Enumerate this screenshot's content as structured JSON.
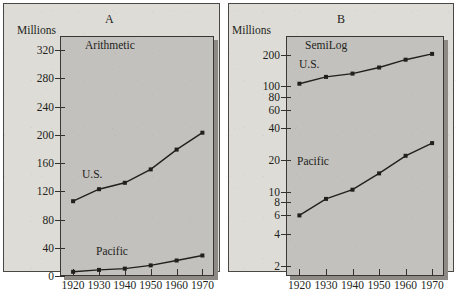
{
  "figure": {
    "axis_caption": "Millions",
    "panel_a_letter": "A",
    "panel_b_letter": "B",
    "panel_a_title": "Arithmetic",
    "panel_b_title": "SemiLog",
    "series_label_us": "U.S.",
    "series_label_pacific": "Pacific",
    "colors": {
      "page_background": "#ffffff",
      "panel_background": "#dedcd6",
      "plot_background": "#c2c1bd",
      "plot_shadow": "#8d8a86",
      "ink": "#231f1c",
      "axis": "#34312e"
    }
  },
  "chart_data": [
    {
      "type": "line",
      "title": "Arithmetic",
      "panel": "A",
      "xlabel": "",
      "ylabel": "Millions",
      "yscale": "linear",
      "ylim": [
        0,
        340
      ],
      "yticks": [
        0,
        40,
        80,
        120,
        160,
        200,
        240,
        280,
        320
      ],
      "ytick_labels": [
        "0",
        "40",
        "80",
        "120",
        "160",
        "200",
        "240",
        "280",
        "320"
      ],
      "x": [
        1920,
        1930,
        1940,
        1950,
        1960,
        1970
      ],
      "xtick_labels": [
        "1920",
        "1930",
        "1940",
        "1950",
        "1960",
        "1970"
      ],
      "grid": false,
      "legend": "inline annotations",
      "series": [
        {
          "name": "U.S.",
          "values": [
            106,
            123,
            132,
            151,
            179,
            203
          ]
        },
        {
          "name": "Pacific",
          "values": [
            6,
            8.6,
            10.5,
            15,
            22,
            29
          ]
        }
      ]
    },
    {
      "type": "line",
      "title": "SemiLog",
      "panel": "B",
      "xlabel": "",
      "ylabel": "Millions",
      "yscale": "log",
      "ylim": [
        1.6,
        300
      ],
      "yticks": [
        2,
        4,
        6,
        8,
        10,
        20,
        40,
        60,
        80,
        100,
        200
      ],
      "ytick_labels": [
        "2",
        "4",
        "6",
        "8",
        "10",
        "20",
        "40",
        "60",
        "80",
        "100",
        "200"
      ],
      "x": [
        1920,
        1930,
        1940,
        1950,
        1960,
        1970
      ],
      "xtick_labels": [
        "1920",
        "1930",
        "1940",
        "1950",
        "1960",
        "1970"
      ],
      "grid": false,
      "legend": "inline annotations",
      "series": [
        {
          "name": "U.S.",
          "values": [
            106,
            123,
            132,
            151,
            179,
            203
          ]
        },
        {
          "name": "Pacific",
          "values": [
            6,
            8.6,
            10.5,
            15,
            22,
            29
          ]
        }
      ]
    }
  ]
}
